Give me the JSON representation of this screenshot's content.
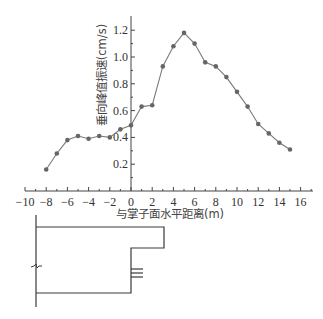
{
  "chart_data": {
    "type": "line",
    "title": "",
    "xlabel": "与掌子面水平距离(m)",
    "ylabel": "垂向峰值振速(cm/s)",
    "xlim": [
      -10,
      17
    ],
    "ylim": [
      0,
      1.3
    ],
    "x_ticks": [
      -10,
      -8,
      -6,
      -4,
      -2,
      0,
      2,
      4,
      6,
      8,
      10,
      12,
      14,
      16
    ],
    "x_tick_labels": [
      "−10",
      "−8",
      "−6",
      "−4",
      "−2",
      "0",
      "2",
      "4",
      "6",
      "8",
      "10",
      "12",
      "14",
      "16"
    ],
    "y_ticks": [
      0.2,
      0.4,
      0.6,
      0.8,
      1.0,
      1.2
    ],
    "y_tick_labels": [
      "0.2",
      "0.4",
      "0.6",
      "0.8",
      "1.0",
      "1.2"
    ],
    "grid": false,
    "legend": null,
    "series": [
      {
        "name": "垂向峰值振速",
        "marker": "circle",
        "color": "#6b6b6b",
        "x": [
          -8,
          -7,
          -6,
          -5,
          -4,
          -3,
          -2,
          -1,
          0,
          1,
          2,
          3,
          4,
          5,
          6,
          7,
          8,
          9,
          10,
          11,
          12,
          13,
          14,
          15
        ],
        "values": [
          0.16,
          0.28,
          0.38,
          0.41,
          0.39,
          0.41,
          0.4,
          0.46,
          0.49,
          0.63,
          0.64,
          0.93,
          1.08,
          1.18,
          1.1,
          0.96,
          0.93,
          0.85,
          0.74,
          0.63,
          0.5,
          0.43,
          0.36,
          0.31
        ]
      }
    ],
    "annotations": [
      "Tunnel face schematic below chart (step-shaped excavation profile with blast holes)"
    ]
  },
  "colors": {
    "axis": "#444444",
    "line": "#7a7a7a",
    "marker": "#666666"
  }
}
